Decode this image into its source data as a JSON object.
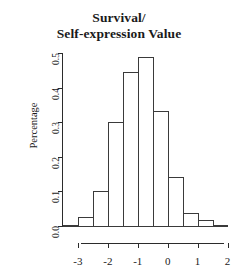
{
  "chart_data": {
    "type": "bar",
    "title": "Survival/ Self-expression Value",
    "title_lines": [
      "Survival/",
      "Self-expression Value"
    ],
    "xlabel": "",
    "ylabel": "Percentage",
    "xlim": [
      -3.5,
      2.0
    ],
    "ylim": [
      0.0,
      0.5
    ],
    "grid": false,
    "legend": null,
    "bin_width": 0.5,
    "bin_edges": [
      -3.5,
      -3.0,
      -2.5,
      -2.0,
      -1.5,
      -1.0,
      -0.5,
      0.0,
      0.5,
      1.0,
      1.5,
      2.0
    ],
    "categories": [
      "-3.5 to -3.0",
      "-3.0 to -2.5",
      "-2.5 to -2.0",
      "-2.0 to -1.5",
      "-1.5 to -1.0",
      "-1.0 to -0.5",
      "-0.5 to 0.0",
      "0.0 to 0.5",
      "0.5 to 1.0",
      "1.0 to 1.5",
      "1.5 to 2.0"
    ],
    "values": [
      0.004,
      0.027,
      0.1,
      0.3,
      0.445,
      0.488,
      0.332,
      0.143,
      0.037,
      0.017,
      0.004
    ],
    "y_ticks": [
      0.0,
      0.1,
      0.2,
      0.3,
      0.4,
      0.5
    ],
    "y_tick_labels": [
      "0.0",
      "0.1",
      "0.2",
      "0.3",
      "0.4",
      "0.5"
    ],
    "x_ticks": [
      -3,
      -2,
      -1,
      0,
      1,
      2
    ],
    "x_tick_labels": [
      "-3",
      "-2",
      "-1",
      "0",
      "1",
      "2"
    ],
    "bar_edge_color": "#3a3a3a",
    "bar_fill_color": "transparent",
    "axis_color": "#2b2b2b",
    "background_color": "#ffffff"
  }
}
